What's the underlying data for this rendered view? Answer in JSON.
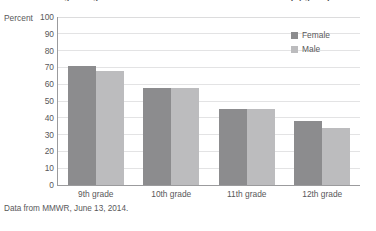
{
  "chart_data": {
    "type": "bar",
    "title": "Percentage of high school students who have ever had intercourse (by grade)",
    "xlabel": "",
    "ylabel": "Percent",
    "ylim": [
      0,
      100
    ],
    "ytick_step": 10,
    "yticks": [
      "100",
      "90",
      "80",
      "70",
      "60",
      "50",
      "40",
      "30",
      "20",
      "10",
      "0"
    ],
    "grid": true,
    "legend_position": "top-right",
    "categories": [
      "9th grade",
      "10th grade",
      "11th grade",
      "12th grade"
    ],
    "series": [
      {
        "name": "Female",
        "color": "#8c8c8e",
        "values": [
          71,
          58,
          45,
          38
        ]
      },
      {
        "name": "Male",
        "color": "#bcbcbe",
        "values": [
          68,
          58,
          45,
          34
        ]
      }
    ],
    "source_note": "Data from MMWR, June 13, 2014."
  },
  "colors": {
    "female": "#8c8c8e",
    "male": "#bcbcbe",
    "axis": "#9b9b9d",
    "grid": "#e3e3e4",
    "text": "#58585a",
    "background": "#ffffff"
  }
}
